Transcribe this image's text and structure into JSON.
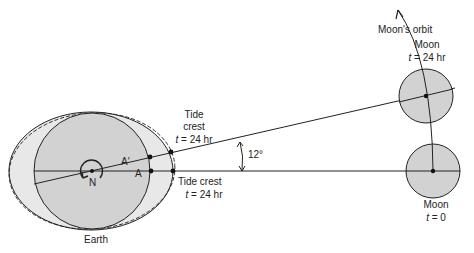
{
  "diagram": {
    "labels": {
      "moons_orbit": "Moon's orbit",
      "moon_t24_title": "Moon",
      "moon_t24_time_var": "t",
      "moon_t24_time_val": " = 24 hr",
      "moon_t0_title": "Moon",
      "moon_t0_time_var": "t",
      "moon_t0_time_val": " = 0",
      "tide_crest_upper_1": "Tide",
      "tide_crest_upper_2": "crest",
      "tide_crest_upper_time_var": "t",
      "tide_crest_upper_time_val": " = 24 hr",
      "tide_crest_lower": "Tide crest",
      "tide_crest_lower_time_var": "t",
      "tide_crest_lower_time_val": " = 24 hr",
      "angle": "12°",
      "point_a_prime": "A′",
      "point_a": "A",
      "north_pole": "N",
      "earth": "Earth"
    },
    "colors": {
      "body_fill": "#d2d2d2",
      "bulge_fill": "#e8e8e8",
      "stroke": "#222222"
    }
  }
}
